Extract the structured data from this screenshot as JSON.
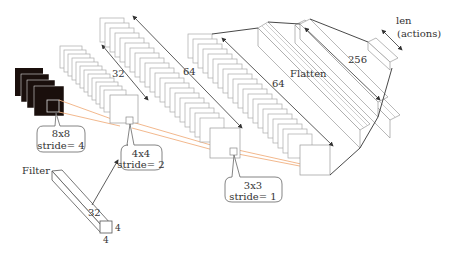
{
  "diagram": {
    "type": "cnn-architecture",
    "input": {
      "frames": 4,
      "kernel_label_size": "8x8",
      "kernel_label_stride": "stride= 4"
    },
    "conv1": {
      "channels_label": "32",
      "kernel_label_size": "4x4",
      "kernel_label_stride": "stride= 2"
    },
    "conv2": {
      "channels_label": "64",
      "kernel_label_size": "3x3",
      "kernel_label_stride": "stride= 1"
    },
    "conv3": {
      "channels_label": "64"
    },
    "flatten": {
      "label": "Flatten"
    },
    "dense": {
      "units_label": "256"
    },
    "output": {
      "label_line1": "len",
      "label_line2": "(actions)"
    },
    "filter": {
      "label": "Filter",
      "depth_label": "32",
      "width_label": "4",
      "height_label": "4"
    },
    "colors": {
      "frame_fill": "#1a0f0c",
      "stroke": "#555555",
      "arrow": "#333333",
      "projection": "#f0b080"
    }
  }
}
